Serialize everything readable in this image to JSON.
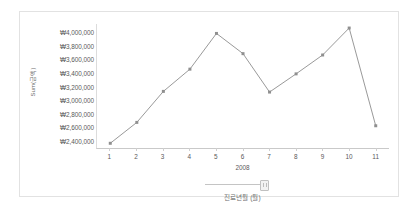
{
  "chart_data": {
    "type": "line",
    "title": "",
    "xlabel": "진료년월 (월)",
    "ylabel": "Sum(금액)",
    "group_label": "2008",
    "categories": [
      "1",
      "2",
      "3",
      "4",
      "5",
      "6",
      "7",
      "8",
      "9",
      "10",
      "11"
    ],
    "values": [
      2350000,
      2660000,
      3120000,
      3450000,
      3980000,
      3680000,
      3110000,
      3380000,
      3660000,
      4060000,
      2610000
    ],
    "ytick_labels": [
      "₩4,000,000",
      "₩3,800,000",
      "₩3,600,000",
      "₩3,400,000",
      "₩3,200,000",
      "₩3,000,000",
      "₩2,800,000",
      "₩2,600,000",
      "₩2,400,000"
    ],
    "ytick_values": [
      4000000,
      3800000,
      3600000,
      3400000,
      3200000,
      3000000,
      2800000,
      2600000,
      2400000
    ],
    "ylim": [
      2280000,
      4120000
    ],
    "grid": false,
    "legend": false,
    "series_color": "#989898",
    "marker": "square",
    "marker_color": "#8f8f8f"
  },
  "filter": {
    "handle_name": "year-filter-handle",
    "track_name": "year-filter-track"
  },
  "frame": {
    "border_color": "#e2e2e2",
    "background": "#ffffff"
  }
}
